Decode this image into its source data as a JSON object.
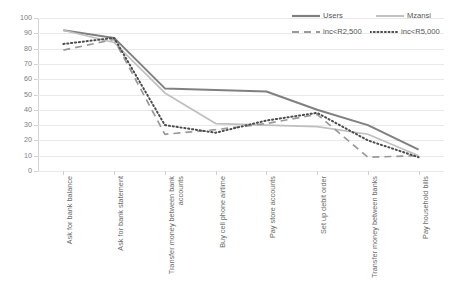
{
  "chart_data": {
    "type": "line",
    "title": "",
    "subtitle": "",
    "xlabel": "",
    "ylabel": "",
    "ylim": [
      0,
      100
    ],
    "ytick_step": 10,
    "yticks": [
      "100",
      "90",
      "80",
      "70",
      "60",
      "50",
      "40",
      "30",
      "20",
      "10",
      "0"
    ],
    "grid": true,
    "legend_position": "top-right",
    "categories": [
      "Ask for bank balance",
      "Ask for bank statement",
      "Transfer money between bank accounts",
      "Buy cell phone airtime",
      "Pay store accounts",
      "Set up debit order",
      "Transfer money between banks",
      "Pay household bills"
    ],
    "series": [
      {
        "name": "Users",
        "style": "solid",
        "color": "#808080",
        "values": [
          92,
          87,
          54,
          53,
          52,
          40,
          30,
          14
        ]
      },
      {
        "name": "Mzansi",
        "style": "solid-light",
        "color": "#bfbfbf",
        "values": [
          92,
          84,
          51,
          31,
          30,
          29,
          24,
          10
        ]
      },
      {
        "name": "inc<R2,500",
        "style": "dashed",
        "color": "#999999",
        "values": [
          79,
          86,
          24,
          27,
          31,
          37,
          9,
          10
        ]
      },
      {
        "name": "inc<R5,000",
        "style": "dotted",
        "color": "#4d4d4d",
        "values": [
          83,
          87,
          30,
          25,
          33,
          38,
          20,
          9
        ]
      }
    ]
  },
  "legend": {
    "items": [
      {
        "label": "Users",
        "icon": "solid-line-swatch"
      },
      {
        "label": "Mzansi",
        "icon": "solid-line-swatch"
      },
      {
        "label": "inc<R2,500",
        "icon": "dashed-line-swatch"
      },
      {
        "label": "inc<R5,000",
        "icon": "dotted-line-swatch"
      }
    ]
  }
}
